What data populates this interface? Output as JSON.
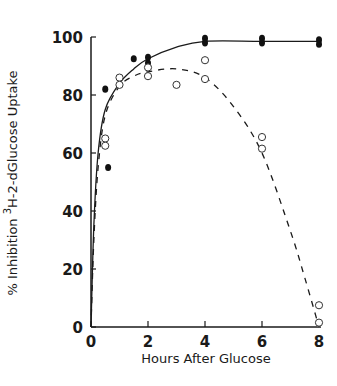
{
  "chart_data": {
    "type": "scatter",
    "title": "",
    "xlabel": "Hours After Glucose",
    "ylabel": "% Inhibition 3H-2-dGlucose Uptake",
    "ylabel_parts": {
      "prefix": "% Inhibition ",
      "superscript": "3",
      "suffix": "H-2-dGlucose Uptake"
    },
    "xlim": [
      0,
      8
    ],
    "ylim": [
      0,
      100
    ],
    "x_ticks": [
      0,
      2,
      4,
      6,
      8
    ],
    "y_ticks": [
      0,
      20,
      40,
      60,
      80,
      100
    ],
    "x_tick_labels": [
      "0",
      "2",
      "4",
      "6",
      "8"
    ],
    "y_tick_labels": [
      "0",
      "20",
      "40",
      "60",
      "80",
      "100"
    ],
    "grid": false,
    "legend": null,
    "series": [
      {
        "name": "filled circles",
        "marker": "filled-circle",
        "points": [
          [
            0.5,
            82
          ],
          [
            0.6,
            55
          ],
          [
            1.5,
            92.5
          ],
          [
            2,
            93
          ],
          [
            2,
            91
          ],
          [
            4,
            99.5
          ],
          [
            4,
            98
          ],
          [
            6,
            99.5
          ],
          [
            6,
            98
          ],
          [
            8,
            99
          ],
          [
            8,
            97.5
          ]
        ],
        "fit_line": {
          "style": "solid",
          "points": [
            [
              0,
              0
            ],
            [
              0.1,
              35
            ],
            [
              0.25,
              60
            ],
            [
              0.5,
              75
            ],
            [
              1,
              84
            ],
            [
              1.5,
              89
            ],
            [
              2,
              92.5
            ],
            [
              3,
              96.5
            ],
            [
              4,
              98.5
            ],
            [
              6,
              98.5
            ],
            [
              8,
              98.5
            ]
          ]
        }
      },
      {
        "name": "open circles",
        "marker": "open-circle",
        "points": [
          [
            0.5,
            65
          ],
          [
            0.5,
            62.5
          ],
          [
            1,
            86
          ],
          [
            1,
            83.5
          ],
          [
            2,
            89.5
          ],
          [
            2,
            86.5
          ],
          [
            3,
            83.5
          ],
          [
            4,
            92
          ],
          [
            4,
            85.5
          ],
          [
            6,
            65.5
          ],
          [
            6,
            61.5
          ],
          [
            8,
            7.5
          ],
          [
            8,
            1.5
          ]
        ],
        "fit_line": {
          "style": "dashed",
          "points": [
            [
              0,
              0
            ],
            [
              0.1,
              30
            ],
            [
              0.25,
              55
            ],
            [
              0.5,
              73
            ],
            [
              1,
              83
            ],
            [
              1.5,
              86.5
            ],
            [
              2,
              88
            ],
            [
              3,
              89
            ],
            [
              4,
              86
            ],
            [
              5,
              76
            ],
            [
              6,
              60
            ],
            [
              7,
              33
            ],
            [
              7.5,
              17
            ],
            [
              8,
              0
            ]
          ]
        }
      }
    ]
  }
}
